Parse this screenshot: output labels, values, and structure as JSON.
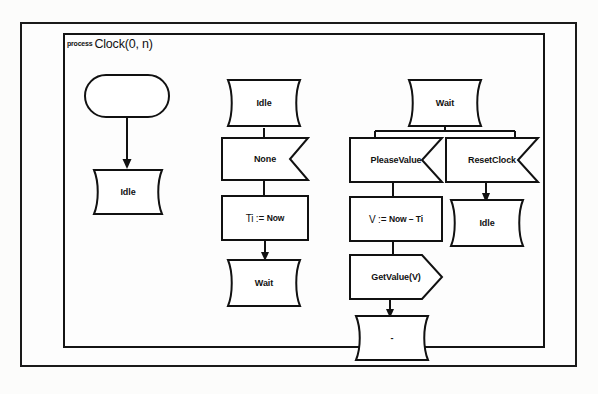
{
  "page": {
    "background_color": "#fcfcfb",
    "frame_color": "#141414"
  },
  "header": {
    "keyword": "process",
    "signature": "Clock(0, n)"
  },
  "diagram": {
    "type": "sdl-process-diagram",
    "columns": [
      {
        "name": "start-column",
        "nodes": [
          {
            "id": "start",
            "shape": "start",
            "label": ""
          },
          {
            "id": "state-idle-1",
            "shape": "state",
            "label": "Idle"
          }
        ],
        "edges": [
          {
            "from": "start",
            "to": "state-idle-1",
            "arrow": true
          }
        ]
      },
      {
        "name": "idle-transition-column",
        "nodes": [
          {
            "id": "state-idle-2",
            "shape": "state",
            "label": "Idle"
          },
          {
            "id": "input-none",
            "shape": "input",
            "label": "None"
          },
          {
            "id": "task-ti",
            "shape": "task",
            "label": "Ti := Now"
          },
          {
            "id": "state-wait-1",
            "shape": "state",
            "label": "Wait"
          }
        ],
        "edges": [
          {
            "from": "state-idle-2",
            "to": "input-none",
            "arrow": false
          },
          {
            "from": "input-none",
            "to": "task-ti",
            "arrow": false
          },
          {
            "from": "task-ti",
            "to": "state-wait-1",
            "arrow": true
          }
        ]
      },
      {
        "name": "wait-transition-column",
        "nodes": [
          {
            "id": "state-wait-2",
            "shape": "state",
            "label": "Wait"
          },
          {
            "id": "input-pleasevalue",
            "shape": "input",
            "label": "PleaseValue"
          },
          {
            "id": "input-resetclock",
            "shape": "input",
            "label": "ResetClock"
          },
          {
            "id": "task-v",
            "shape": "task",
            "label": "V := Now – Ti"
          },
          {
            "id": "output-getvalue",
            "shape": "output",
            "label": "GetValue(V)"
          },
          {
            "id": "state-dash",
            "shape": "state",
            "label": "-"
          },
          {
            "id": "state-idle-3",
            "shape": "state",
            "label": "Idle"
          }
        ],
        "edges": [
          {
            "from": "state-wait-2",
            "to": "input-pleasevalue",
            "arrow": false
          },
          {
            "from": "state-wait-2",
            "to": "input-resetclock",
            "arrow": false
          },
          {
            "from": "input-pleasevalue",
            "to": "task-v",
            "arrow": false
          },
          {
            "from": "input-resetclock",
            "to": "state-idle-3",
            "arrow": true
          },
          {
            "from": "task-v",
            "to": "output-getvalue",
            "arrow": false
          },
          {
            "from": "output-getvalue",
            "to": "state-dash",
            "arrow": true
          }
        ]
      }
    ]
  },
  "labels": {
    "start_empty": "",
    "idle_1": "Idle",
    "idle_2": "Idle",
    "idle_3": "Idle",
    "none": "None",
    "task_ti_var": "Ti",
    "task_ti_op": ":=",
    "task_ti_val": "Now",
    "wait_1": "Wait",
    "wait_2": "Wait",
    "pleasevalue": "PleaseValue",
    "resetclock": "ResetClock",
    "task_v_var": "V",
    "task_v_op": ":=",
    "task_v_val": "Now – Ti",
    "getvalue": "GetValue(V)",
    "dash_state": "-"
  }
}
